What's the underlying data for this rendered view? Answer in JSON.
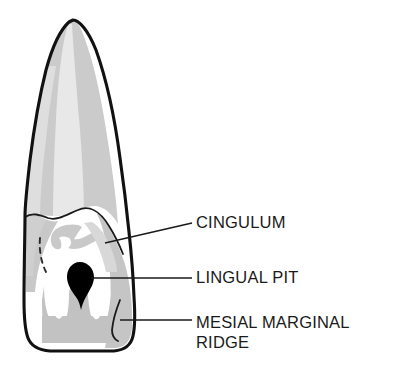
{
  "figure": {
    "background_color": "#ffffff",
    "outline_color": "#111111",
    "labels": [
      {
        "id": "cingulum",
        "text": "CINGULUM",
        "text_x": 196,
        "text_y": 228,
        "leader_from_x": 105,
        "leader_from_y": 243,
        "leader_to_x": 192,
        "leader_to_y": 223
      },
      {
        "id": "lingual-pit",
        "text": "LINGUAL PIT",
        "text_x": 196,
        "text_y": 283,
        "leader_from_x": 91,
        "leader_from_y": 278,
        "leader_to_x": 192,
        "leader_to_y": 278
      },
      {
        "id": "mesial-marginal-ridge",
        "text_line1": "MESIAL MARGINAL",
        "text_line2": "RIDGE",
        "text_x": 196,
        "text_y": 328,
        "text_y2": 348,
        "leader_from_x": 120,
        "leader_from_y": 320,
        "leader_to_x": 192,
        "leader_to_y": 320
      }
    ],
    "anatomy": {
      "root_shading": "#c9c9c9",
      "root_highlight": "#e3e3e3",
      "crown_enamel": "#ffffff",
      "crown_shading": "#c2c2c2",
      "cingulum_shading": "#c9c9c9",
      "lingual_pit_fill": "#000000"
    }
  }
}
